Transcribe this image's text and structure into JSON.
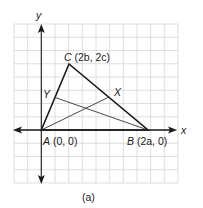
{
  "figure": {
    "caption": "(a)",
    "axes": {
      "x_label": "x",
      "y_label": "y"
    },
    "points": {
      "A": {
        "name": "A",
        "coords": "(0, 0)"
      },
      "B": {
        "name": "B",
        "coords": "(2a, 0)"
      },
      "C": {
        "name": "C",
        "coords": "(2b, 2c)"
      },
      "X": {
        "name": "X"
      },
      "Y": {
        "name": "Y"
      }
    },
    "colors": {
      "grid": "#d6d6d6",
      "triangle": "#1a1a1a",
      "median": "#333333",
      "axis": "#1a1a1a"
    }
  }
}
